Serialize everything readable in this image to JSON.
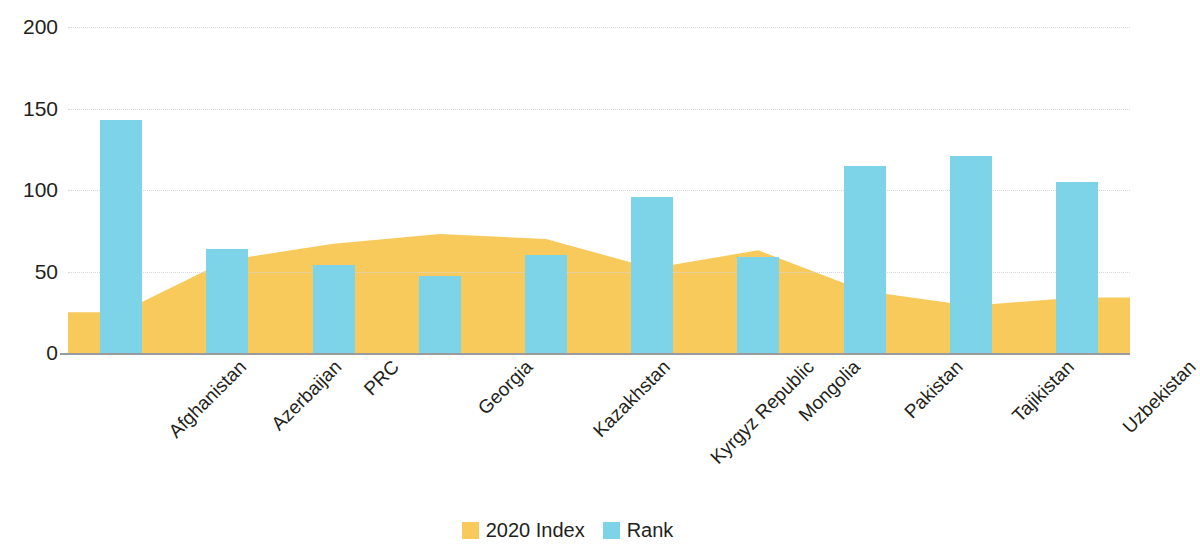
{
  "chart_data": {
    "type": "bar",
    "title": "",
    "subtitle": "",
    "xlabel": "",
    "ylabel": "",
    "ylim": [
      0,
      200
    ],
    "yticks": [
      0,
      50,
      100,
      150,
      200
    ],
    "grid": true,
    "legend_position": "bottom",
    "categories": [
      "Afghanistan",
      "Azerbaijan",
      "PRC",
      "Georgia",
      "Kazakhstan",
      "Kyrgyz Republic",
      "Mongolia",
      "Pakistan",
      "Tajikistan",
      "Uzbekistan"
    ],
    "series": [
      {
        "name": "2020 Index",
        "type": "area",
        "color": "#F8CA5C",
        "values": [
          25,
          57,
          67,
          73,
          70,
          52,
          63,
          38,
          29,
          34
        ]
      },
      {
        "name": "Rank",
        "type": "bar",
        "color": "#7DD3E8",
        "values": [
          143,
          64,
          54,
          47,
          60,
          96,
          59,
          115,
          121,
          105
        ]
      }
    ]
  },
  "axis": {
    "y_tick_labels": [
      "200",
      "150",
      "100",
      "50",
      "0"
    ]
  },
  "legend": {
    "items": [
      {
        "label": "2020 Index",
        "color": "#F8CA5C"
      },
      {
        "label": "Rank",
        "color": "#7DD3E8"
      }
    ]
  }
}
